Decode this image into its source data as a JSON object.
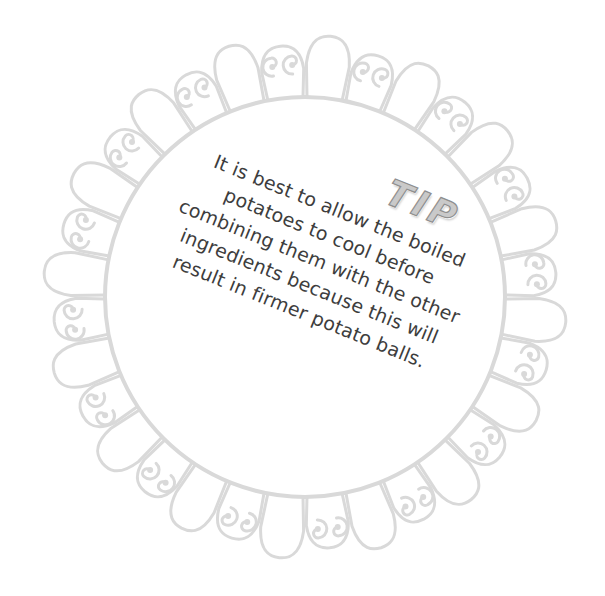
{
  "tip": {
    "title": "TIP",
    "lines": [
      "It is best to allow the boiled",
      "potatoes to cool before",
      "combining them with the other",
      "ingredients because this will",
      "result in firmer potato balls."
    ]
  },
  "frame": {
    "center": [
      305,
      297
    ],
    "inner_radius": 200,
    "petal_count": 32,
    "stroke_color": "#d9d9d9",
    "text_color": "#3d3d3d",
    "title_fill": "#c9c9c9",
    "title_stroke": "#8f8f8f",
    "rotation_deg": 22
  }
}
